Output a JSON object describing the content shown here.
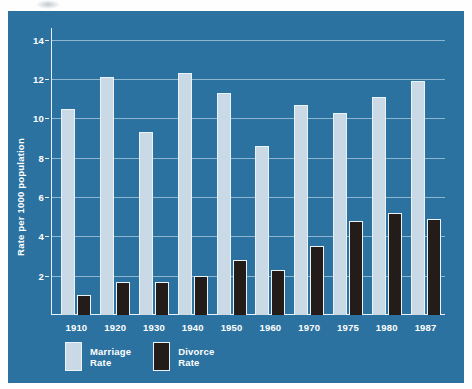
{
  "chart_data": {
    "type": "bar",
    "title": "",
    "xlabel": "",
    "ylabel": "Rate per 1000 population",
    "categories": [
      "1910",
      "1920",
      "1930",
      "1940",
      "1950",
      "1960",
      "1970",
      "1975",
      "1980",
      "1987"
    ],
    "series": [
      {
        "name": "Marriage Rate",
        "color": "#c9dae6",
        "values": [
          10.5,
          12.1,
          9.3,
          12.3,
          11.3,
          8.6,
          10.7,
          10.3,
          11.1,
          11.9
        ]
      },
      {
        "name": "Divorce Rate",
        "color": "#241c18",
        "values": [
          1.0,
          1.7,
          1.7,
          2.0,
          2.8,
          2.3,
          3.5,
          4.8,
          5.2,
          4.9
        ]
      }
    ],
    "ylim": [
      0,
      14.6
    ],
    "yticks": [
      2,
      4,
      6,
      8,
      10,
      12,
      14
    ],
    "ytick_labels": [
      "2",
      "4",
      "6",
      "8",
      "10",
      "12",
      "14"
    ],
    "grid": true,
    "legend_position": "bottom-left",
    "background_color": "#2b72a1",
    "axis_color": "#e8f1f6",
    "text_color": "#ffffff"
  },
  "legend": {
    "items": [
      {
        "label_line1": "Marriage",
        "label_line2": "Rate",
        "swatch": "marriage-swatch"
      },
      {
        "label_line1": "Divorce",
        "label_line2": "Rate",
        "swatch": "divorce-swatch"
      }
    ]
  }
}
